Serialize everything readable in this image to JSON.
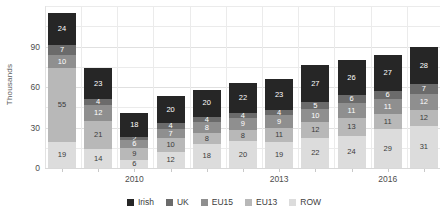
{
  "chart_data": {
    "type": "bar",
    "subtype": "stacked-column",
    "title": "",
    "xlabel": "",
    "ylabel": "Thousands",
    "ylim": [
      0,
      120
    ],
    "yticks": [
      0,
      30,
      60,
      90
    ],
    "ytick_labels": [
      "0",
      "30",
      "60",
      "90"
    ],
    "grid": true,
    "legend_position": "bottom",
    "categories": [
      "",
      "",
      "2010",
      "",
      "",
      "",
      "2013",
      "",
      "",
      "2016",
      ""
    ],
    "xtick_labels": [
      "2010",
      "2013",
      "2016"
    ],
    "xtick_indices": [
      2,
      6,
      9
    ],
    "series": [
      {
        "name": "Irish",
        "color": "#262626",
        "label_color": "#ffffff",
        "values": [
          24,
          23,
          18,
          20,
          20,
          22,
          23,
          27,
          26,
          27,
          28
        ]
      },
      {
        "name": "UK",
        "color": "#6b6b6b",
        "label_color": "#ffffff",
        "values": [
          7,
          4,
          2,
          4,
          4,
          4,
          4,
          5,
          6,
          6,
          7
        ]
      },
      {
        "name": "EU15",
        "color": "#8f8f8f",
        "label_color": "#ffffff",
        "values": [
          10,
          12,
          6,
          7,
          8,
          9,
          9,
          10,
          11,
          11,
          12
        ]
      },
      {
        "name": "EU13",
        "color": "#b8b8b8",
        "label_color": "#3a3a3a",
        "values": [
          55,
          21,
          9,
          10,
          8,
          8,
          11,
          12,
          13,
          11,
          12
        ]
      },
      {
        "name": "ROW",
        "color": "#dcdcdc",
        "label_color": "#3a3a3a",
        "values": [
          19,
          14,
          6,
          12,
          18,
          20,
          19,
          22,
          24,
          29,
          31
        ]
      }
    ],
    "totals": [
      115,
      74,
      41,
      53,
      58,
      63,
      66,
      76,
      80,
      84,
      90
    ]
  },
  "colors": {
    "background": "#ffffff",
    "gridline": "#ebebeb",
    "axis_text": "#4d4d4d",
    "axis_title": "#5b5b5b"
  }
}
